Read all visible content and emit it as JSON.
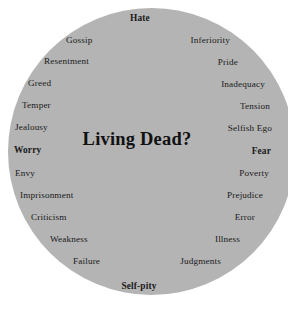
{
  "diagram": {
    "type": "word-circle",
    "shape": "circle",
    "fill_color": "#b4b4b4",
    "background_color": "#ffffff",
    "text_color": "#1a1a1a",
    "center_label": "Living Dead?",
    "top_label": {
      "text": "Hate",
      "bold": true
    },
    "bottom_label": {
      "text": "Self-pity",
      "bold": true
    },
    "left_words": [
      {
        "text": "Gossip",
        "bold": false
      },
      {
        "text": "Resentment",
        "bold": false
      },
      {
        "text": "Greed",
        "bold": false
      },
      {
        "text": "Temper",
        "bold": false
      },
      {
        "text": "Jealousy",
        "bold": false
      },
      {
        "text": "Worry",
        "bold": true
      },
      {
        "text": "Envy",
        "bold": false
      },
      {
        "text": "Imprisonment",
        "bold": false
      },
      {
        "text": "Criticism",
        "bold": false
      },
      {
        "text": "Weakness",
        "bold": false
      },
      {
        "text": "Failure",
        "bold": false
      }
    ],
    "right_words": [
      {
        "text": "Inferiority",
        "bold": false
      },
      {
        "text": "Pride",
        "bold": false
      },
      {
        "text": "Inadequacy",
        "bold": false
      },
      {
        "text": "Tension",
        "bold": false
      },
      {
        "text": "Selfish Ego",
        "bold": false
      },
      {
        "text": "Fear",
        "bold": true
      },
      {
        "text": "Poverty",
        "bold": false
      },
      {
        "text": "Prejudice",
        "bold": false
      },
      {
        "text": "Error",
        "bold": false
      },
      {
        "text": "Illness",
        "bold": false
      },
      {
        "text": "Judgments",
        "bold": false
      }
    ]
  }
}
